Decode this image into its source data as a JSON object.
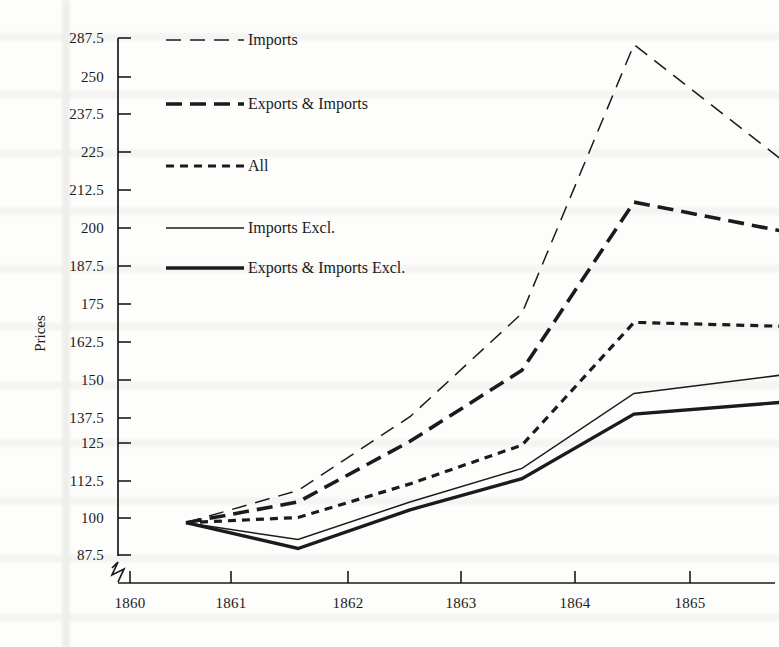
{
  "figure": {
    "ylabel": "Prices",
    "xlabel": ""
  },
  "chart_data": {
    "type": "line",
    "title": "",
    "xlabel": "",
    "ylabel": "Prices",
    "grid": false,
    "legend_position": "top-left-inside",
    "xlim": [
      1860,
      1865.9
    ],
    "ylim": [
      81.25,
      287.5
    ],
    "xticks": [
      "1860",
      "1861",
      "1862",
      "1863",
      "1864",
      "1865"
    ],
    "xtick_values": [
      1860,
      1861,
      1862,
      1863,
      1864,
      1865
    ],
    "yticks": [
      "287.5",
      "250",
      "237.5",
      "225",
      "212.5",
      "200",
      "187.5",
      "175",
      "162.5",
      "150",
      "137.5",
      "125",
      "112.5",
      "100",
      "87.5"
    ],
    "ytick_values": [
      287.5,
      262.5,
      237.5,
      225,
      212.5,
      200,
      187.5,
      175,
      162.5,
      150,
      137.5,
      125,
      112.5,
      100,
      87.5
    ],
    "axis_break": "y-axis broken below 87.5",
    "x": [
      1860.5,
      1861.5,
      1862.5,
      1863.5,
      1864.5,
      1865.8
    ],
    "series": [
      {
        "name": "Imports",
        "style": "long-dash-thin",
        "values": [
          100,
          112.5,
          141,
          181,
          285,
          241
        ]
      },
      {
        "name": "Exports & Imports",
        "style": "long-dash-thick",
        "values": [
          100,
          108,
          131.5,
          159,
          224,
          213
        ]
      },
      {
        "name": "All",
        "style": "short-dash",
        "values": [
          100,
          102,
          115,
          130,
          177.5,
          176
        ]
      },
      {
        "name": "Imports Excl.",
        "style": "solid-thin",
        "values": [
          100,
          93.5,
          108,
          121,
          150,
          157
        ]
      },
      {
        "name": "Exports & Imports Excl.",
        "style": "solid-thick",
        "values": [
          100,
          90,
          105,
          117,
          142,
          146.5
        ]
      }
    ]
  },
  "legend": {
    "items": [
      {
        "label": "Imports",
        "style": "long-dash-thin"
      },
      {
        "label": "Exports & Imports",
        "style": "long-dash-thick"
      },
      {
        "label": "All",
        "style": "short-dash"
      },
      {
        "label": "Imports Excl.",
        "style": "solid-thin"
      },
      {
        "label": "Exports & Imports Excl.",
        "style": "solid-thick"
      }
    ]
  },
  "colors": {
    "ink": "#1b1b1b",
    "paper": "#fdfdfb"
  }
}
